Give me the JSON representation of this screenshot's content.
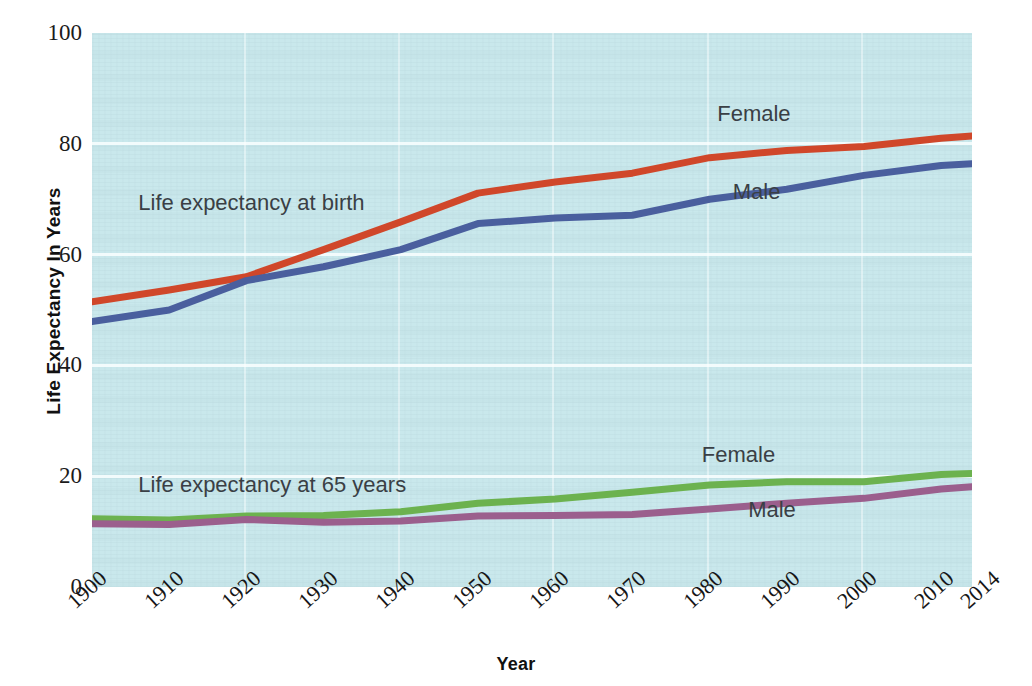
{
  "chart_data": {
    "type": "line",
    "title": "",
    "xlabel": "Year",
    "ylabel": "Life Expectancy In Years",
    "xlim": [
      1900,
      2014
    ],
    "ylim": [
      0,
      100
    ],
    "grid": true,
    "legend_position": "inline-labels",
    "background_color": "#c9e8ec",
    "x": [
      1900,
      1910,
      1920,
      1930,
      1940,
      1950,
      1960,
      1970,
      1980,
      1990,
      2000,
      2010,
      2014
    ],
    "xtick_labels": [
      "1900",
      "1910",
      "1920",
      "1930",
      "1940",
      "1950",
      "1960",
      "1970",
      "1980",
      "1990",
      "2000",
      "2010",
      "2014"
    ],
    "ytick_labels": [
      "0",
      "20",
      "40",
      "60",
      "80",
      "100"
    ],
    "ytick_values": [
      0,
      20,
      40,
      60,
      80,
      100
    ],
    "annotations": [
      {
        "text": "Life expectancy at birth",
        "x": 1906,
        "y": 69
      },
      {
        "text": "Life expectancy at 65 years",
        "x": 1906,
        "y": 18
      }
    ],
    "series": [
      {
        "name": "Female",
        "group": "Life expectancy at birth",
        "color": "#d0472a",
        "label_text": "Female",
        "label_x": 1981,
        "label_y": 85,
        "values": [
          51.5,
          53.6,
          56.0,
          60.9,
          65.9,
          71.1,
          73.1,
          74.7,
          77.5,
          78.8,
          79.5,
          81.0,
          81.4
        ]
      },
      {
        "name": "Male",
        "group": "Life expectancy at birth",
        "color": "#4a5f9e",
        "label_text": "Male",
        "label_x": 1983,
        "label_y": 71,
        "values": [
          47.9,
          50.0,
          55.3,
          57.8,
          60.9,
          65.6,
          66.6,
          67.1,
          70.0,
          71.8,
          74.3,
          76.1,
          76.4
        ]
      },
      {
        "name": "Female",
        "group": "Life expectancy at 65 years",
        "color": "#6cb24f",
        "label_text": "Female",
        "label_x": 1979,
        "label_y": 23.5,
        "values": [
          12.3,
          12.1,
          12.8,
          12.9,
          13.6,
          15.1,
          15.9,
          17.1,
          18.4,
          19.0,
          19.0,
          20.3,
          20.5
        ]
      },
      {
        "name": "Male",
        "group": "Life expectancy at 65 years",
        "color": "#9b5f8d",
        "label_text": "Male",
        "label_x": 1985,
        "label_y": 13.5,
        "values": [
          11.4,
          11.3,
          12.2,
          11.7,
          11.9,
          12.8,
          12.9,
          13.1,
          14.1,
          15.1,
          16.0,
          17.7,
          18.1
        ]
      }
    ]
  }
}
